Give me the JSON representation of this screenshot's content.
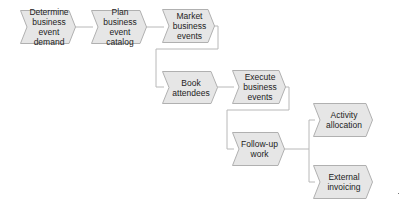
{
  "diagram": {
    "colors": {
      "fill": "#e6e6e6",
      "stroke": "#b0b0b0",
      "connector": "#b8b8b8",
      "text": "#222222"
    },
    "nodes": [
      {
        "id": "determine",
        "label": "Determine\nbusiness event\ndemand"
      },
      {
        "id": "plan",
        "label": "Plan\nbusiness event\ncatalog"
      },
      {
        "id": "market",
        "label": "Market\nbusiness\nevents"
      },
      {
        "id": "book",
        "label": "Book\nattendees"
      },
      {
        "id": "execute",
        "label": "Execute\nbusiness\nevents"
      },
      {
        "id": "followup",
        "label": "Follow-up\nwork"
      },
      {
        "id": "activity",
        "label": "Activity\nallocation"
      },
      {
        "id": "external",
        "label": "External\ninvoicing"
      }
    ],
    "edges": [
      {
        "from": "determine",
        "to": "plan"
      },
      {
        "from": "plan",
        "to": "market"
      },
      {
        "from": "market",
        "to": "book"
      },
      {
        "from": "book",
        "to": "execute"
      },
      {
        "from": "execute",
        "to": "followup"
      },
      {
        "from": "followup",
        "to": "activity"
      },
      {
        "from": "followup",
        "to": "external"
      }
    ]
  }
}
